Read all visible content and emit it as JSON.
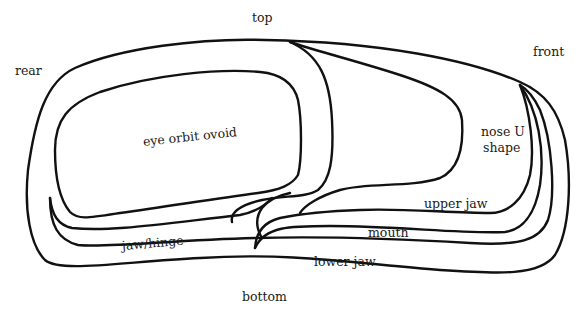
{
  "diagram": {
    "title": "",
    "stroke_color": "#111111",
    "background": "#ffffff",
    "direction_labels": {
      "top": "top",
      "bottom": "bottom",
      "rear": "rear",
      "front": "front"
    },
    "region_labels": {
      "eye_orbit": "eye orbit ovoid",
      "nose_line1": "nose U",
      "nose_line2": "shape",
      "upper_jaw": "upper jaw",
      "mouth": "mouth",
      "lower_jaw": "lower jaw",
      "jaw_hinge": "jaw/hinge"
    }
  }
}
